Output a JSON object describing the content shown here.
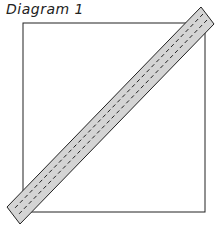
{
  "diagram": {
    "title": "Diagram 1",
    "square": {
      "x": 23,
      "y": 23,
      "width": 182,
      "height": 189,
      "stroke": "#222222",
      "fill": "#ffffff"
    },
    "strip": {
      "points": "201,7 214,24 20,224 7,207",
      "fill": "#d4d4d4",
      "stroke": "#222222"
    },
    "seam_lines": [
      {
        "x1": 203,
        "y1": 14,
        "x2": 13,
        "y2": 210
      },
      {
        "x1": 207,
        "y1": 20,
        "x2": 17,
        "y2": 216
      }
    ],
    "seam_color": "#222222"
  }
}
